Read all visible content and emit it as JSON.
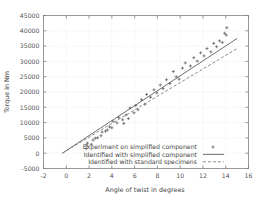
{
  "chart_data": {
    "type": "scatter",
    "title": "",
    "xlabel": "Angle of twist in degrees",
    "ylabel": "Torque in Nm",
    "xlim": [
      -2,
      16
    ],
    "ylim": [
      -5000,
      45000
    ],
    "xticks": [
      -2,
      0,
      2,
      4,
      6,
      8,
      10,
      12,
      14,
      16
    ],
    "yticks": [
      -5000,
      0,
      5000,
      10000,
      15000,
      20000,
      25000,
      30000,
      35000,
      40000,
      45000
    ],
    "xtick_labels": [
      "-2",
      "0",
      "2",
      "4",
      "6",
      "8",
      "10",
      "12",
      "14",
      "16"
    ],
    "ytick_labels": [
      "-5000",
      "0",
      "5000",
      "10000",
      "15000",
      "20000",
      "25000",
      "30000",
      "35000",
      "40000",
      "45000"
    ],
    "grid": true,
    "grid_color": "#dddddd",
    "border_color": "#808080",
    "legend_position": "bottom-center",
    "series": [
      {
        "name": "Experiment on simplified component",
        "style": "scatter",
        "marker": "plus",
        "color": "#555555",
        "points": [
          [
            1.75,
            1500
          ],
          [
            1.8,
            2600
          ],
          [
            1.85,
            3300
          ],
          [
            2.2,
            2900
          ],
          [
            2.35,
            4300
          ],
          [
            2.55,
            4900
          ],
          [
            2.75,
            5050
          ],
          [
            3.05,
            5700
          ],
          [
            3.15,
            6900
          ],
          [
            3.45,
            7200
          ],
          [
            3.6,
            7600
          ],
          [
            3.8,
            8600
          ],
          [
            4.0,
            8300
          ],
          [
            4.1,
            10450
          ],
          [
            4.45,
            9900
          ],
          [
            4.6,
            11700
          ],
          [
            4.95,
            10900
          ],
          [
            5.05,
            9700
          ],
          [
            5.25,
            12500
          ],
          [
            5.45,
            11300
          ],
          [
            5.6,
            14800
          ],
          [
            5.95,
            13200
          ],
          [
            6.1,
            15600
          ],
          [
            6.3,
            14200
          ],
          [
            6.6,
            17500
          ],
          [
            6.9,
            16000
          ],
          [
            7.05,
            19200
          ],
          [
            7.4,
            18300
          ],
          [
            7.7,
            20700
          ],
          [
            7.95,
            19700
          ],
          [
            8.25,
            22300
          ],
          [
            8.5,
            21100
          ],
          [
            8.8,
            24000
          ],
          [
            9.1,
            22800
          ],
          [
            9.4,
            26700
          ],
          [
            9.65,
            25000
          ],
          [
            9.9,
            24200
          ],
          [
            10.2,
            27800
          ],
          [
            10.45,
            29500
          ],
          [
            10.9,
            28500
          ],
          [
            11.2,
            31200
          ],
          [
            11.5,
            30100
          ],
          [
            11.8,
            32800
          ],
          [
            12.1,
            31800
          ],
          [
            12.35,
            34200
          ],
          [
            12.7,
            33100
          ],
          [
            12.95,
            35900
          ],
          [
            13.2,
            34800
          ],
          [
            13.45,
            36700
          ],
          [
            13.7,
            36200
          ],
          [
            13.9,
            39200
          ],
          [
            14.05,
            38600
          ],
          [
            14.1,
            41000
          ]
        ]
      },
      {
        "name": "Identified with simplified component",
        "style": "line",
        "dash": "solid",
        "color": "#555555",
        "points": [
          [
            -0.35,
            0
          ],
          [
            15.0,
            37500
          ]
        ]
      },
      {
        "name": "Identified with standard specimens",
        "style": "line",
        "dash": "dashed",
        "color": "#777777",
        "points": [
          [
            -0.35,
            0
          ],
          [
            15.0,
            34200
          ]
        ]
      }
    ]
  },
  "legend": {
    "entries": [
      {
        "label": "Experiment on simplified component",
        "marker": "plus"
      },
      {
        "label": "Identified with simplified component",
        "marker": "solid-line"
      },
      {
        "label": "Identified with standard specimens",
        "marker": "dashed-line"
      }
    ]
  }
}
